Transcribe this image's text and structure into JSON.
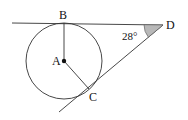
{
  "diagram": {
    "type": "geometry",
    "points": {
      "A": {
        "label": "A",
        "x": 64,
        "y": 61
      },
      "B": {
        "label": "B",
        "x": 64,
        "y": 23
      },
      "C": {
        "label": "C",
        "x": 89,
        "y": 89
      },
      "D": {
        "label": "D",
        "x": 163,
        "y": 25
      }
    },
    "circle": {
      "center": "A",
      "radius": 38
    },
    "angle": {
      "vertex": "D",
      "value": "28°",
      "shaded": true,
      "shade_color": "#b8b8b8"
    },
    "colors": {
      "stroke": "#222222",
      "background": "#ffffff"
    }
  }
}
